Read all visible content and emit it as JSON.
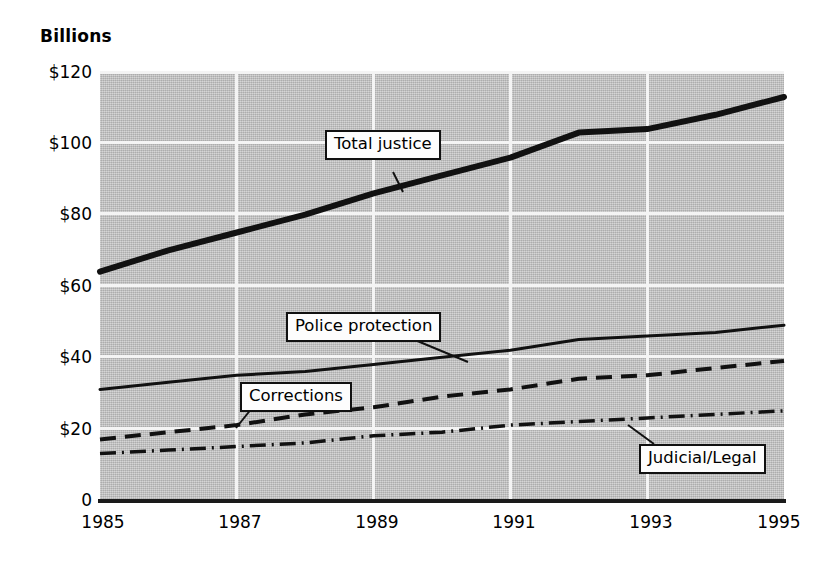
{
  "chart_data": {
    "type": "line",
    "title": "",
    "subtitle": "",
    "axis_title": "Billions",
    "xlabel": "",
    "ylabel": "Billions",
    "x": [
      1985,
      1986,
      1987,
      1988,
      1989,
      1990,
      1991,
      1992,
      1993,
      1994,
      1995
    ],
    "xlim": [
      1985,
      1995
    ],
    "ylim": [
      0,
      120
    ],
    "y_ticks": [
      0,
      20,
      40,
      60,
      80,
      100,
      120
    ],
    "y_tick_labels": [
      "0",
      "$20",
      "$40",
      "$60",
      "$80",
      "$100",
      "$120"
    ],
    "x_ticks": [
      1985,
      1987,
      1989,
      1991,
      1993,
      1995
    ],
    "x_tick_labels": [
      "1985",
      "1987",
      "1989",
      "1991",
      "1993",
      "1995"
    ],
    "grid": true,
    "grid_color": "#f4f4f4",
    "plot_background": "#c0c0c0",
    "legend_position": "inline-callouts",
    "series": [
      {
        "name": "Total justice",
        "style": "solid-thick",
        "color": "#111111",
        "values": [
          64,
          70,
          75,
          80,
          86,
          91,
          96,
          103,
          104,
          108,
          113
        ]
      },
      {
        "name": "Police protection",
        "style": "solid-thin",
        "color": "#111111",
        "values": [
          31,
          33,
          35,
          36,
          38,
          40,
          42,
          45,
          46,
          47,
          49
        ]
      },
      {
        "name": "Corrections",
        "style": "dashed",
        "color": "#111111",
        "values": [
          17,
          19,
          21,
          24,
          26,
          29,
          31,
          34,
          35,
          37,
          39
        ]
      },
      {
        "name": "Judicial/Legal",
        "style": "dash-dot",
        "color": "#111111",
        "values": [
          13,
          14,
          15,
          16,
          18,
          19,
          21,
          22,
          23,
          24,
          25
        ]
      }
    ],
    "annotations": [
      {
        "text": "Total justice",
        "series": "Total justice"
      },
      {
        "text": "Police protection",
        "series": "Police protection"
      },
      {
        "text": "Corrections",
        "series": "Corrections"
      },
      {
        "text": "Judicial/Legal",
        "series": "Judicial/Legal"
      }
    ]
  }
}
